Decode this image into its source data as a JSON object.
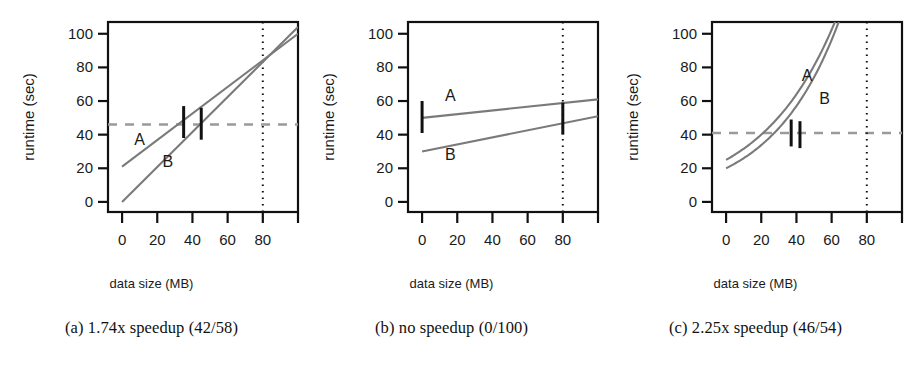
{
  "figure": {
    "panel_count": 3,
    "axis": {
      "xlabel": "data size (MB)",
      "ylabel": "runtime (sec)",
      "xticks": [
        0,
        20,
        40,
        60,
        80
      ],
      "xtick_labels": [
        "0",
        "20",
        "40",
        "60",
        "80"
      ],
      "yticks": [
        0,
        20,
        40,
        60,
        80,
        100
      ],
      "ytick_labels": [
        "0",
        "20",
        "40",
        "60",
        "80",
        "100"
      ],
      "xlim": [
        -8,
        100
      ],
      "ylim": [
        -6,
        107
      ]
    },
    "colors": {
      "curve": "#7a7a7a",
      "errorbar": "#111111",
      "axis": "#111111",
      "threshold_line": "#9a9a9a",
      "budget_line": "#111111",
      "text": "#1a1a1a"
    }
  },
  "panels": [
    {
      "id": "a",
      "caption": "(a) 1.74x speedup (42/58)",
      "xlabel": "data size (MB)",
      "ylabel": "runtime (sec)",
      "series": [
        {
          "name": "A",
          "label": "A",
          "label_x": 10,
          "label_y": 34,
          "type": "line",
          "x": [
            0,
            100
          ],
          "y": [
            21,
            100
          ]
        },
        {
          "name": "B",
          "label": "B",
          "label_x": 26,
          "label_y": 21,
          "type": "line",
          "x": [
            0,
            100
          ],
          "y": [
            0,
            104
          ]
        }
      ],
      "error_bars": [
        {
          "series": "A",
          "x": 35,
          "y": 48,
          "low": 38,
          "high": 57
        },
        {
          "series": "B",
          "x": 45,
          "y": 47,
          "low": 37,
          "high": 56
        }
      ],
      "threshold_line": {
        "y": 46,
        "style": "dashed",
        "visible": true
      },
      "budget_line": {
        "x": 80,
        "style": "dotted",
        "visible": true
      }
    },
    {
      "id": "b",
      "caption": "(b) no speedup (0/100)",
      "xlabel": "data size (MB)",
      "ylabel": "runtime (sec)",
      "series": [
        {
          "name": "A",
          "label": "A",
          "label_x": 16,
          "label_y": 60,
          "type": "line",
          "x": [
            0,
            100
          ],
          "y": [
            50,
            61
          ]
        },
        {
          "name": "B",
          "label": "B",
          "label_x": 16,
          "label_y": 25,
          "type": "line",
          "x": [
            0,
            100
          ],
          "y": [
            30,
            51
          ]
        }
      ],
      "error_bars": [
        {
          "series": "A",
          "x": 0,
          "y": 50,
          "low": 41,
          "high": 60
        },
        {
          "series": "B",
          "x": 80,
          "y": 47,
          "low": 40,
          "high": 59
        }
      ],
      "threshold_line": {
        "y": 46,
        "style": "dashed",
        "visible": false
      },
      "budget_line": {
        "x": 80,
        "style": "dotted",
        "visible": true
      }
    },
    {
      "id": "c",
      "caption": "(c) 2.25x speedup (46/54)",
      "xlabel": "data size (MB)",
      "ylabel": "runtime (sec)",
      "series": [
        {
          "name": "A",
          "label": "A",
          "label_x": 46,
          "label_y": 72,
          "type": "exponential",
          "y0": 25,
          "growth": 0.0235,
          "x_start": 0,
          "x_end": 92
        },
        {
          "name": "B",
          "label": "B",
          "label_x": 56,
          "label_y": 58,
          "type": "exponential",
          "y0": 20,
          "growth": 0.0262,
          "x_start": 0,
          "x_end": 95
        }
      ],
      "error_bars": [
        {
          "series": "A",
          "x": 37,
          "y": 41,
          "low": 33,
          "high": 49
        },
        {
          "series": "B",
          "x": 42,
          "y": 41,
          "low": 32,
          "high": 48
        }
      ],
      "threshold_line": {
        "y": 41,
        "style": "dashed",
        "visible": true
      },
      "budget_line": {
        "x": 80,
        "style": "dotted",
        "visible": true
      }
    }
  ],
  "chart_data": {
    "type": "line",
    "title": "",
    "xlabel": "data size (MB)",
    "ylabel": "runtime (sec)",
    "xlim": [
      -8,
      100
    ],
    "ylim": [
      -6,
      107
    ],
    "grid": false,
    "legend": "inline-labels",
    "panels": [
      {
        "panel": "a",
        "caption": "(a) 1.74x speedup (42/58)",
        "series": [
          {
            "name": "A",
            "x": [
              0,
              20,
              40,
              60,
              80,
              100
            ],
            "values": [
              21,
              37,
              52,
              68,
              84,
              100
            ]
          },
          {
            "name": "B",
            "x": [
              0,
              20,
              40,
              60,
              80,
              100
            ],
            "values": [
              0,
              21,
              42,
              62,
              83,
              104
            ]
          }
        ],
        "error_bars": [
          {
            "series": "A",
            "x": 35,
            "y": 48,
            "low": 38,
            "high": 57
          },
          {
            "series": "B",
            "x": 45,
            "y": 47,
            "low": 37,
            "high": 56
          }
        ],
        "threshold": 46,
        "budget_x": 80
      },
      {
        "panel": "b",
        "caption": "(b) no speedup (0/100)",
        "series": [
          {
            "name": "A",
            "x": [
              0,
              20,
              40,
              60,
              80,
              100
            ],
            "values": [
              50,
              52,
              54,
              57,
              59,
              61
            ]
          },
          {
            "name": "B",
            "x": [
              0,
              20,
              40,
              60,
              80,
              100
            ],
            "values": [
              30,
              34,
              38,
              43,
              47,
              51
            ]
          }
        ],
        "error_bars": [
          {
            "series": "A",
            "x": 0,
            "y": 50,
            "low": 41,
            "high": 60
          },
          {
            "series": "B",
            "x": 80,
            "y": 47,
            "low": 40,
            "high": 59
          }
        ],
        "threshold": null,
        "budget_x": 80
      },
      {
        "panel": "c",
        "caption": "(c) 2.25x speedup (46/54)",
        "series": [
          {
            "name": "A",
            "x": [
              0,
              20,
              40,
              60,
              80,
              92
            ],
            "values": [
              25,
              40,
              64,
              103,
              164,
              218
            ]
          },
          {
            "name": "B",
            "x": [
              0,
              20,
              40,
              60,
              80,
              95
            ],
            "values": [
              20,
              34,
              57,
              96,
              163,
              241
            ]
          }
        ],
        "error_bars": [
          {
            "series": "A",
            "x": 37,
            "y": 41,
            "low": 33,
            "high": 49
          },
          {
            "series": "B",
            "x": 42,
            "y": 41,
            "low": 32,
            "high": 48
          }
        ],
        "threshold": 41,
        "budget_x": 80
      }
    ]
  }
}
